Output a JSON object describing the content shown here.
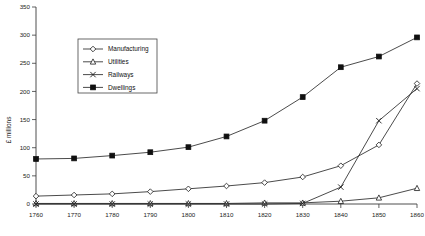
{
  "chart_data": {
    "type": "line",
    "title": "",
    "xlabel": "",
    "ylabel": "£ millions",
    "x": [
      1760,
      1770,
      1780,
      1790,
      1800,
      1810,
      1820,
      1830,
      1840,
      1850,
      1860
    ],
    "categories": [
      "1760",
      "1770",
      "1780",
      "1790",
      "1800",
      "1810",
      "1820",
      "1830",
      "1840",
      "1850",
      "1860"
    ],
    "xlim": [
      1760,
      1860
    ],
    "ylim": [
      0,
      350
    ],
    "yticks": [
      0,
      50,
      100,
      150,
      200,
      250,
      300,
      350
    ],
    "ytick_labels": [
      "0",
      "50",
      "100",
      "150",
      "200",
      "250",
      "300",
      "350"
    ],
    "grid": false,
    "legend_position": "upper-left-inset",
    "series": [
      {
        "name": "Manufacturing",
        "marker": "open-diamond",
        "values": [
          14,
          16,
          18,
          22,
          27,
          32,
          38,
          48,
          68,
          105,
          214
        ]
      },
      {
        "name": "Utilities",
        "marker": "open-triangle",
        "values": [
          1,
          1,
          1,
          1,
          1,
          1,
          2,
          2,
          5,
          11,
          28
        ]
      },
      {
        "name": "Railways",
        "marker": "x-cross",
        "values": [
          0,
          0,
          0,
          0,
          0,
          0,
          0,
          1,
          30,
          148,
          205
        ]
      },
      {
        "name": "Dwellings",
        "marker": "filled-square",
        "values": [
          80,
          81,
          86,
          92,
          101,
          120,
          148,
          190,
          243,
          262,
          296
        ]
      }
    ]
  },
  "legend": {
    "entries": [
      {
        "label": "Manufacturing"
      },
      {
        "label": "Utilities"
      },
      {
        "label": "Railways"
      },
      {
        "label": "Dwellings"
      }
    ]
  },
  "colors": {
    "axis": "#3a3a3a",
    "line": "#2b2b2b",
    "marker_fill_open": "#ffffff",
    "marker_fill_solid": "#101010",
    "background": "#ffffff"
  }
}
